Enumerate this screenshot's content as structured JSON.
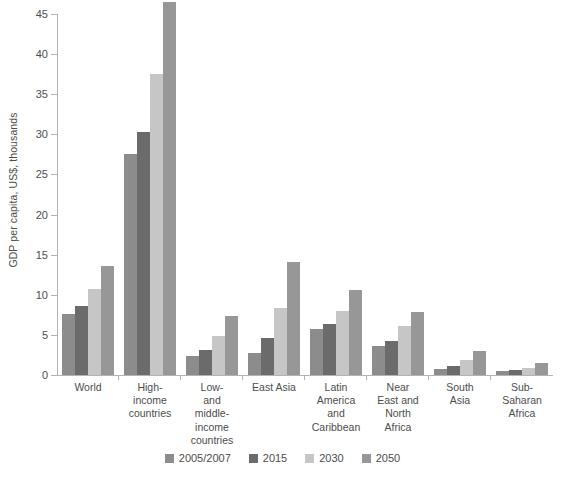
{
  "chart_data": {
    "type": "bar",
    "title": "",
    "subtitle": "",
    "xlabel": "",
    "ylabel": "GDP per capita, US$, thousands",
    "ylim": [
      0,
      45
    ],
    "ytick_labels": [
      "0",
      "5",
      "10",
      "15",
      "20",
      "25",
      "30",
      "35",
      "40",
      "45"
    ],
    "ytick_values": [
      0,
      5,
      10,
      15,
      20,
      25,
      30,
      35,
      40,
      45
    ],
    "grid": false,
    "legend_position": "bottom",
    "categories": [
      "World",
      "High-income countries",
      "Low- and middle-income countries",
      "East Asia",
      "Latin America and Caribbean",
      "Near East and North Africa",
      "South Asia",
      "Sub-Saharan Africa"
    ],
    "series": [
      {
        "name": "2005/2007",
        "color": "#8c8c8c",
        "values": [
          7.6,
          27.5,
          2.4,
          2.8,
          5.7,
          3.6,
          0.8,
          0.5
        ]
      },
      {
        "name": "2015",
        "color": "#6b6b6b",
        "values": [
          8.6,
          30.3,
          3.1,
          4.6,
          6.4,
          4.3,
          1.1,
          0.6
        ]
      },
      {
        "name": "2030",
        "color": "#c6c6c6",
        "values": [
          10.7,
          37.5,
          4.9,
          8.4,
          8.0,
          6.1,
          1.9,
          0.9
        ]
      },
      {
        "name": "2050",
        "color": "#979797",
        "values": [
          13.6,
          46.5,
          7.4,
          14.1,
          10.6,
          7.9,
          3.0,
          1.5
        ]
      }
    ]
  },
  "axis": {
    "y_title": "GDP per capita, US$, thousands"
  },
  "category_label_lines": [
    [
      "World"
    ],
    [
      "High-",
      "income",
      "countries"
    ],
    [
      "Low-",
      "and",
      "middle-",
      "income",
      "countries"
    ],
    [
      "East Asia"
    ],
    [
      "Latin",
      "America",
      "and",
      "Caribbean"
    ],
    [
      "Near",
      "East and",
      "North",
      "Africa"
    ],
    [
      "South",
      "Asia"
    ],
    [
      "Sub-",
      "Saharan",
      "Africa"
    ]
  ],
  "legend": {
    "items": [
      {
        "label": "2005/2007",
        "color": "#8c8c8c"
      },
      {
        "label": "2015",
        "color": "#6b6b6b"
      },
      {
        "label": "2030",
        "color": "#c6c6c6"
      },
      {
        "label": "2050",
        "color": "#979797"
      }
    ]
  }
}
